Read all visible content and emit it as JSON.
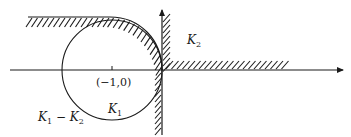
{
  "figure": {
    "colors": {
      "ink": "#1a1a1a",
      "background": "#ffffff"
    },
    "labels": {
      "point": "(−1,0)",
      "k1": "K",
      "k1_sub": "1",
      "k2": "K",
      "k2_sub": "2",
      "diff_a": "K",
      "diff_a_sub": "1",
      "diff_op": " − ",
      "diff_b": "K",
      "diff_b_sub": "2"
    },
    "geometry": {
      "origin": [
        162,
        70
      ],
      "circle_center": [
        112,
        70
      ],
      "circle_radius": 50,
      "critical_point_tick_x": 112
    }
  }
}
